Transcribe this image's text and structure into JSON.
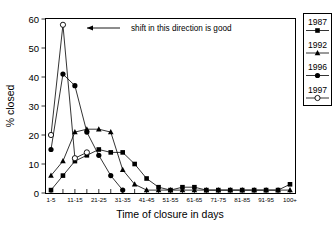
{
  "chart_data": {
    "type": "line",
    "title": "",
    "xlabel": "Time of closure in days",
    "ylabel": "% closed",
    "ylim": [
      0,
      60
    ],
    "yticks": [
      0,
      10,
      20,
      30,
      40,
      50,
      60
    ],
    "grid": false,
    "legend_position": "right-outside",
    "annotation": "shift in this direction is good",
    "annotation_arrow": "left",
    "categories": [
      "1-5",
      "6-10",
      "11-15",
      "16-20",
      "21-25",
      "26-30",
      "31-35",
      "36-40",
      "41-45",
      "46-50",
      "51-55",
      "56-60",
      "61-65",
      "66-70",
      "71-75",
      "76-80",
      "81-85",
      "86-90",
      "91-95",
      "96-100",
      "100+"
    ],
    "xtick_labels": [
      "1-5",
      "11-15",
      "21-25",
      "31-35",
      "41-45",
      "51-55",
      "61-65",
      "71-75",
      "81-85",
      "91-95",
      "100+"
    ],
    "series": [
      {
        "name": "1987",
        "marker": "filled-square",
        "values": [
          1,
          6,
          11,
          13,
          15,
          14,
          14,
          10,
          5,
          2,
          1,
          2,
          2,
          1,
          1,
          1,
          1,
          1,
          1,
          1,
          3
        ]
      },
      {
        "name": "1992",
        "marker": "filled-triangle",
        "values": [
          6,
          11,
          21,
          22,
          22,
          21,
          8,
          3,
          1,
          1,
          1,
          1,
          1,
          1,
          1,
          1,
          1,
          1,
          1,
          1,
          1
        ]
      },
      {
        "name": "1996",
        "marker": "filled-circle",
        "values": [
          15,
          41,
          37,
          21,
          13,
          6,
          1,
          0,
          0,
          0,
          0,
          0,
          0,
          0,
          0,
          0,
          0,
          0,
          0,
          0,
          0
        ]
      },
      {
        "name": "1997",
        "marker": "open-circle",
        "values": [
          20,
          58,
          12,
          14,
          0,
          0,
          0,
          0,
          0,
          0,
          0,
          0,
          0,
          0,
          0,
          0,
          0,
          0,
          0,
          0,
          0
        ]
      }
    ]
  },
  "legend": {
    "entries": [
      {
        "label": "1987",
        "marker": "filled-square"
      },
      {
        "label": "1992",
        "marker": "filled-triangle"
      },
      {
        "label": "1996",
        "marker": "filled-circle"
      },
      {
        "label": "1997",
        "marker": "open-circle"
      }
    ]
  },
  "axes": {
    "y_labels": [
      "60",
      "50",
      "40",
      "30",
      "20",
      "10",
      "0"
    ],
    "y_title": "% closed",
    "x_title": "Time of closure in days",
    "x_labels": [
      "1-5",
      "11-15",
      "21-25",
      "31-35",
      "41-45",
      "51-55",
      "61-65",
      "71-75",
      "81-85",
      "91-95",
      "100+"
    ]
  },
  "annotation": {
    "text": "shift in this direction is good"
  },
  "colors": {
    "ink": "#000000",
    "background": "#ffffff"
  }
}
